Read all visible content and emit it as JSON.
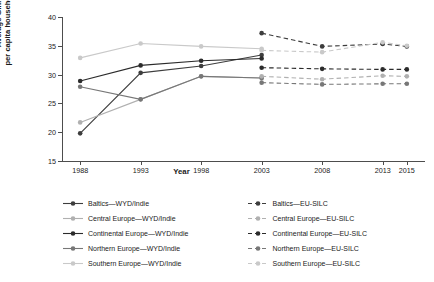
{
  "chart_data": {
    "type": "line",
    "title": "",
    "xlabel": "Year",
    "ylabel": "Average Gini index per capita household income",
    "ylabel_line1": "Average Gini index",
    "ylabel_line2": "per capita household income",
    "x": [
      1988,
      1993,
      1998,
      2003,
      2008,
      2013,
      2015
    ],
    "xticklabels": [
      "1988",
      "1993",
      "1998",
      "2003",
      "2008",
      "2013",
      "2015"
    ],
    "yticklabels": [
      "15",
      "20",
      "25",
      "30",
      "35",
      "40"
    ],
    "yticks": [
      15,
      20,
      25,
      30,
      35,
      40
    ],
    "ylim": [
      15,
      40
    ],
    "xlim": [
      1986.5,
      2016.5
    ],
    "grid": false,
    "legend_position": "below",
    "series": [
      {
        "name": "Baltics—WYD/Indie",
        "source": "WYD/Indie",
        "region": "Baltics",
        "style": "solid",
        "color": "#3d3d3d",
        "x": [
          1988,
          1993,
          1998,
          2003
        ],
        "values": [
          19.8,
          30.3,
          31.5,
          33.4
        ]
      },
      {
        "name": "Central Europe—WYD/Indie",
        "source": "WYD/Indie",
        "region": "Central Europe",
        "style": "solid",
        "color": "#b0b0b0",
        "x": [
          1988,
          1993,
          1998,
          2003
        ],
        "values": [
          21.7,
          25.7,
          29.7,
          29.4
        ]
      },
      {
        "name": "Continental Europe—WYD/Indie",
        "source": "WYD/Indie",
        "region": "Continental Europe",
        "style": "solid",
        "color": "#2b2b2b",
        "x": [
          1988,
          1993,
          1998,
          2003
        ],
        "values": [
          28.9,
          31.6,
          32.4,
          32.8
        ]
      },
      {
        "name": "Northern Europe—WYD/Indie",
        "source": "WYD/Indie",
        "region": "Northern Europe",
        "style": "solid",
        "color": "#777777",
        "x": [
          1988,
          1993,
          1998,
          2003
        ],
        "values": [
          27.9,
          25.7,
          29.7,
          29.4
        ]
      },
      {
        "name": "Southern Europe—WYD/Indie",
        "source": "WYD/Indie",
        "region": "Southern Europe",
        "style": "solid",
        "color": "#c9c9c9",
        "x": [
          1988,
          1993,
          1998,
          2003
        ],
        "values": [
          32.9,
          35.4,
          34.9,
          34.5
        ]
      },
      {
        "name": "Baltics—EU-SILC",
        "source": "EU-SILC",
        "region": "Baltics",
        "style": "dashed",
        "color": "#3d3d3d",
        "x": [
          2003,
          2008,
          2013,
          2015
        ],
        "values": [
          37.2,
          34.9,
          35.3,
          34.9
        ]
      },
      {
        "name": "Central Europe—EU-SILC",
        "source": "EU-SILC",
        "region": "Central Europe",
        "style": "dashed",
        "color": "#b0b0b0",
        "x": [
          2003,
          2008,
          2013,
          2015
        ],
        "values": [
          29.7,
          29.2,
          29.8,
          29.7
        ]
      },
      {
        "name": "Continental Europe—EU-SILC",
        "source": "EU-SILC",
        "region": "Continental Europe",
        "style": "dashed",
        "color": "#2b2b2b",
        "x": [
          2003,
          2008,
          2013,
          2015
        ],
        "values": [
          31.2,
          31.0,
          30.9,
          30.9
        ]
      },
      {
        "name": "Northern Europe—EU-SILC",
        "source": "EU-SILC",
        "region": "Northern Europe",
        "style": "dashed",
        "color": "#777777",
        "x": [
          2003,
          2008,
          2013,
          2015
        ],
        "values": [
          28.6,
          28.3,
          28.4,
          28.4
        ]
      },
      {
        "name": "Southern Europe—EU-SILC",
        "source": "EU-SILC",
        "region": "Southern Europe",
        "style": "dashed",
        "color": "#c9c9c9",
        "x": [
          2003,
          2008,
          2013,
          2015
        ],
        "values": [
          34.2,
          33.9,
          35.6,
          35.0
        ]
      }
    ]
  },
  "legend": {
    "items": [
      {
        "label": "Baltics—WYD/Indie",
        "color": "#3d3d3d",
        "style": "solid"
      },
      {
        "label": "Baltics—EU-SILC",
        "color": "#3d3d3d",
        "style": "dashed"
      },
      {
        "label": "Central Europe—WYD/Indie",
        "color": "#b0b0b0",
        "style": "solid"
      },
      {
        "label": "Central Europe—EU-SILC",
        "color": "#b0b0b0",
        "style": "dashed"
      },
      {
        "label": "Continental Europe—WYD/Indie",
        "color": "#2b2b2b",
        "style": "solid"
      },
      {
        "label": "Continental Europe—EU-SILC",
        "color": "#2b2b2b",
        "style": "dashed"
      },
      {
        "label": "Northern Europe—WYD/Indie",
        "color": "#777777",
        "style": "solid"
      },
      {
        "label": "Northern Europe—EU-SILC",
        "color": "#777777",
        "style": "dashed"
      },
      {
        "label": "Southern Europe—WYD/Indie",
        "color": "#c9c9c9",
        "style": "solid"
      },
      {
        "label": "Southern Europe—EU-SILC",
        "color": "#c9c9c9",
        "style": "dashed"
      }
    ]
  }
}
